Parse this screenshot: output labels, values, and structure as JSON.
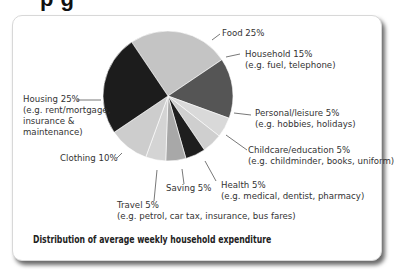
{
  "heading_fragment": "p     g",
  "chart_data": {
    "type": "pie",
    "title": "Distribution of average weekly household expenditure",
    "categories": [
      "Food",
      "Household",
      "Personal/leisure",
      "Childcare/education",
      "Health",
      "Saving",
      "Travel",
      "Clothing",
      "Housing"
    ],
    "values": [
      25,
      15,
      5,
      5,
      5,
      5,
      5,
      10,
      25
    ],
    "unit": "%",
    "slice_colors": [
      "#c4c4c4",
      "#555555",
      "#d9d9d9",
      "#cfcfcf",
      "#1e1e1e",
      "#a8a8a8",
      "#d4d4d4",
      "#cdcdcd",
      "#1c1c1c"
    ],
    "labels": [
      {
        "name": "Food 25%",
        "detail": ""
      },
      {
        "name": "Household 15%",
        "detail": "(e.g. fuel, telephone)"
      },
      {
        "name": "Personal/leisure 5%",
        "detail": "(e.g. hobbies, holidays)"
      },
      {
        "name": "Childcare/education 5%",
        "detail": "(e.g. childminder, books, uniform)"
      },
      {
        "name": "Health 5%",
        "detail": "(e.g. medical, dentist, pharmacy)"
      },
      {
        "name": "Saving 5%",
        "detail": ""
      },
      {
        "name": "Travel 5%",
        "detail": "(e.g. petrol, car tax, insurance, bus fares)"
      },
      {
        "name": "Clothing 10%",
        "detail": ""
      },
      {
        "name": "Housing 25%",
        "detail": "(e.g. rent/mortgage,",
        "detail2": "insurance &",
        "detail3": "maintenance)"
      }
    ],
    "legend": "none (callout labels)"
  },
  "caption": "Distribution of average weekly household expenditure"
}
